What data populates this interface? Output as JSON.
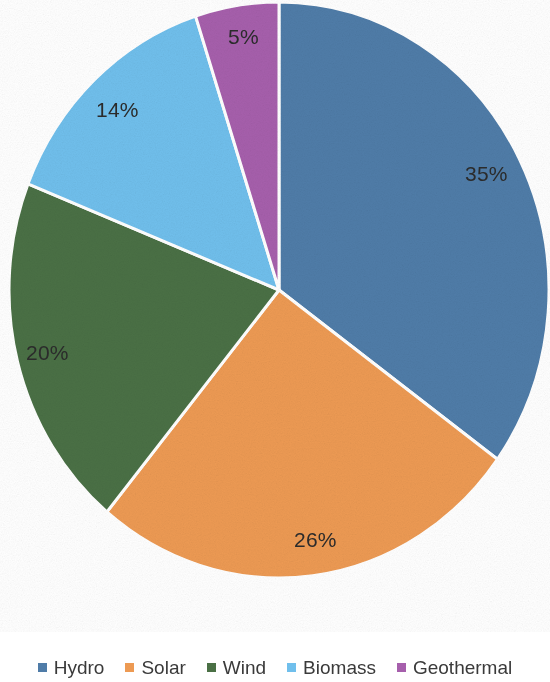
{
  "chart_data": {
    "type": "pie",
    "title": "",
    "subtitle": "",
    "xlabel": "",
    "ylabel": "",
    "categories": [
      "Hydro",
      "Solar",
      "Wind",
      "Biomass",
      "Geothermal"
    ],
    "values": [
      35,
      26,
      20,
      14,
      5
    ],
    "value_unit": "%",
    "data_labels": [
      "35%",
      "26%",
      "20%",
      "14%",
      "5%"
    ],
    "colors": [
      "#4F7CA8",
      "#ED9A53",
      "#4A7045",
      "#70BFEC",
      "#A65FAC"
    ],
    "legend_position": "bottom",
    "grid": false,
    "start_angle_deg": 0,
    "direction": "clockwise",
    "slice_border_color": "#ffffff",
    "label_text_color": "#2b2b2b",
    "series": [
      {
        "name": "Renewable Energy Share",
        "values": [
          35,
          26,
          20,
          14,
          5
        ]
      }
    ],
    "slices": [
      {
        "label": "Hydro",
        "value": 35,
        "data_label": "35%",
        "color": "#4F7CA8"
      },
      {
        "label": "Solar",
        "value": 26,
        "data_label": "26%",
        "color": "#ED9A53"
      },
      {
        "label": "Wind",
        "value": 20,
        "data_label": "20%",
        "color": "#4A7045"
      },
      {
        "label": "Biomass",
        "value": 14,
        "data_label": "14%",
        "color": "#70BFEC"
      },
      {
        "label": "Geothermal",
        "value": 5,
        "data_label": "5%",
        "color": "#A65FAC"
      }
    ]
  },
  "labels": {
    "hydro": "35%",
    "solar": "26%",
    "wind": "20%",
    "biomass": "14%",
    "geothermal": "5%"
  },
  "legend": {
    "items": [
      {
        "label": "Hydro",
        "color": "#4F7CA8"
      },
      {
        "label": "Solar",
        "color": "#ED9A53"
      },
      {
        "label": "Wind",
        "color": "#4A7045"
      },
      {
        "label": "Biomass",
        "color": "#70BFEC"
      },
      {
        "label": "Geothermal",
        "color": "#A65FAC"
      }
    ]
  }
}
